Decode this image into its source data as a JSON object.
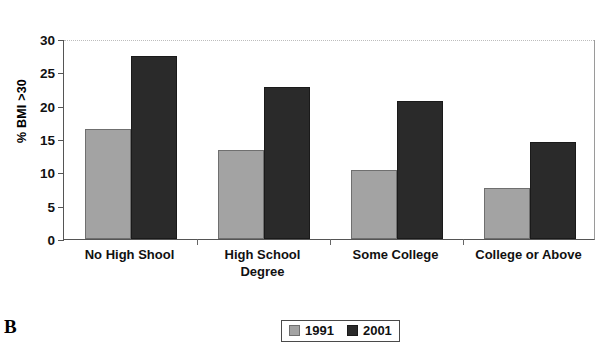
{
  "panel": {
    "letter": "B"
  },
  "chart_data": {
    "type": "bar",
    "title": "",
    "subtitle": "",
    "xlabel": "",
    "ylabel": "% BMI >30",
    "categories": [
      "No High Shool",
      "High School Degree",
      "Some College",
      "College or Above"
    ],
    "categories_lines": [
      [
        "No High Shool"
      ],
      [
        "High School",
        "Degree"
      ],
      [
        "Some College"
      ],
      [
        "College or Above"
      ]
    ],
    "series": [
      {
        "name": "1991",
        "color": "#a3a3a3",
        "values": [
          16.5,
          13.3,
          10.3,
          7.6
        ]
      },
      {
        "name": "2001",
        "color": "#2a2a2a",
        "values": [
          27.4,
          22.8,
          20.7,
          14.5
        ]
      }
    ],
    "ylim": [
      0,
      30
    ],
    "yticks": [
      0,
      5,
      10,
      15,
      20,
      25,
      30
    ],
    "ytick_labels": [
      "0",
      "5",
      "10",
      "15",
      "20",
      "25",
      "30"
    ],
    "grid": "top-dotted-only",
    "legend_position": "bottom-center",
    "legend_entries": [
      "1991",
      "2001"
    ]
  }
}
